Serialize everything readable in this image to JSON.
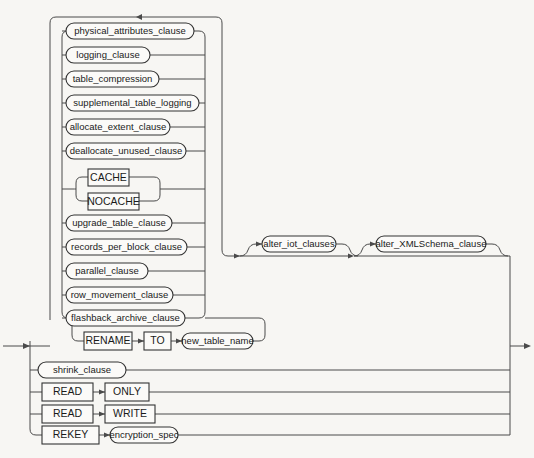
{
  "diagram": {
    "name": "alter_table_properties",
    "type": "railroad-syntax-diagram",
    "background_color": "#f7f6f3",
    "line_color": "#4a4a4a",
    "box_fill_color": "#fbfaf8",
    "box_stroke_color": "#333333",
    "entry_arrow": "left-entry-arrow",
    "exit_arrow": "right-exit-arrow",
    "loop_arrow": "repeat-loop-arrow"
  },
  "alternatives": [
    {
      "id": "physical_attributes_clause",
      "label": "physical_attributes_clause",
      "kind": "nonterminal"
    },
    {
      "id": "logging_clause",
      "label": "logging_clause",
      "kind": "nonterminal"
    },
    {
      "id": "table_compression",
      "label": "table_compression",
      "kind": "nonterminal"
    },
    {
      "id": "supplemental_table_logging",
      "label": "supplemental_table_logging",
      "kind": "nonterminal"
    },
    {
      "id": "allocate_extent_clause",
      "label": "allocate_extent_clause",
      "kind": "nonterminal"
    },
    {
      "id": "deallocate_unused_clause",
      "label": "deallocate_unused_clause",
      "kind": "nonterminal"
    },
    {
      "id": "cache",
      "label": "CACHE",
      "kind": "terminal"
    },
    {
      "id": "nocache",
      "label": "NOCACHE",
      "kind": "terminal"
    },
    {
      "id": "upgrade_table_clause",
      "label": "upgrade_table_clause",
      "kind": "nonterminal"
    },
    {
      "id": "records_per_block_clause",
      "label": "records_per_block_clause",
      "kind": "nonterminal"
    },
    {
      "id": "parallel_clause",
      "label": "parallel_clause",
      "kind": "nonterminal"
    },
    {
      "id": "row_movement_clause",
      "label": "row_movement_clause",
      "kind": "nonterminal"
    },
    {
      "id": "flashback_archive_clause",
      "label": "flashback_archive_clause",
      "kind": "nonterminal"
    }
  ],
  "rename_row": {
    "rename_keyword": "RENAME",
    "to_keyword": "TO",
    "new_table_name": "new_table_name"
  },
  "outer_alternatives": [
    {
      "id": "shrink_clause",
      "label": "shrink_clause",
      "kind": "nonterminal"
    }
  ],
  "read_only_row": {
    "read_keyword": "READ",
    "mode_keyword": "ONLY"
  },
  "read_write_row": {
    "read_keyword": "READ",
    "mode_keyword": "WRITE"
  },
  "rekey_row": {
    "rekey_keyword": "REKEY",
    "encryption_spec": "encryption_spec"
  },
  "optional_tail": [
    {
      "id": "alter_iot_clauses",
      "label": "alter_iot_clauses",
      "kind": "nonterminal"
    },
    {
      "id": "alter_XMLSchema_clause",
      "label": "alter_XMLSchema_clause",
      "kind": "nonterminal"
    }
  ]
}
